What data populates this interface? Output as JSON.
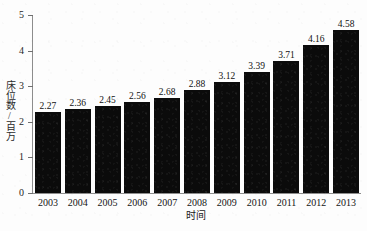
{
  "chart_data": {
    "type": "bar",
    "title": "",
    "subtitle": "",
    "xlabel": "时间",
    "ylabel": "床位数/百万",
    "categories": [
      "2003",
      "2004",
      "2005",
      "2006",
      "2007",
      "2008",
      "2009",
      "2010",
      "2011",
      "2012",
      "2013"
    ],
    "values": [
      2.27,
      2.36,
      2.45,
      2.56,
      2.68,
      2.88,
      3.12,
      3.39,
      3.71,
      4.16,
      4.58
    ],
    "data_labels": [
      "2.27",
      "2.36",
      "2.45",
      "2.56",
      "2.68",
      "2.88",
      "3.12",
      "3.39",
      "3.71",
      "4.16",
      "4.58"
    ],
    "ylim": [
      0,
      5
    ],
    "y_ticks": [
      0,
      1,
      2,
      3,
      4,
      5
    ],
    "y_tick_labels": [
      "0",
      "1",
      "2",
      "3",
      "4",
      "5"
    ],
    "grid": false,
    "legend": false,
    "legend_position": "none",
    "series": [
      {
        "name": "床位数/百万",
        "values": [
          2.27,
          2.36,
          2.45,
          2.56,
          2.68,
          2.88,
          3.12,
          3.39,
          3.71,
          4.16,
          4.58
        ],
        "color": "#0b0b0b"
      }
    ],
    "colors": {
      "bar": "#0b0b0b",
      "axis": "#8d8d8d",
      "text": "#151515",
      "background": "#fdfdfd"
    }
  }
}
